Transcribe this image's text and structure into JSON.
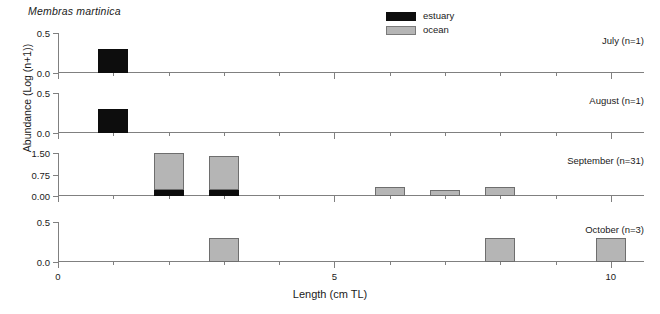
{
  "figure": {
    "species_title": "Membras martinica",
    "axis_titles": {
      "x": "Length (cm TL)",
      "y": "Abundance (Log (n+1))"
    }
  },
  "legend": {
    "items": [
      {
        "label": "estuary",
        "color": "#0d0d0d",
        "swatch_name": "estuary-swatch"
      },
      {
        "label": "ocean",
        "color": "#b5b5b5",
        "swatch_name": "ocean-swatch"
      }
    ]
  },
  "chart_data": {
    "type": "bar",
    "title": "Membras martinica",
    "xlabel": "Length (cm TL)",
    "ylabel": "Abundance (Log (n+1))",
    "grid": false,
    "legend_position": "top-center",
    "stacked": true,
    "series_names": [
      "estuary",
      "ocean"
    ],
    "series_colors": {
      "estuary": "#0d0d0d",
      "ocean": "#b5b5b5"
    },
    "xlim": [
      0,
      10.6
    ],
    "x_major_ticks": [
      0,
      5,
      10
    ],
    "x_major_tick_labels": [
      "0",
      "5",
      "10"
    ],
    "x_minor_ticks": [
      1,
      2,
      3,
      4,
      6,
      7,
      8,
      9
    ],
    "panels": [
      {
        "name": "july",
        "label": "July (n=1)",
        "ylim": [
          0,
          0.5
        ],
        "y_ticks": [
          0.0,
          0.5
        ],
        "y_tick_labels": [
          "0.0",
          "0.5"
        ],
        "bars": [
          {
            "x": 1,
            "estuary": 0.3,
            "ocean": 0
          }
        ]
      },
      {
        "name": "august",
        "label": "August (n=1)",
        "ylim": [
          0,
          0.5
        ],
        "y_ticks": [
          0.0,
          0.5
        ],
        "y_tick_labels": [
          "0.0",
          "0.5"
        ],
        "bars": [
          {
            "x": 1,
            "estuary": 0.3,
            "ocean": 0
          }
        ]
      },
      {
        "name": "september",
        "label": "September (n=31)",
        "ylim": [
          0,
          1.5
        ],
        "y_ticks": [
          0.0,
          0.75,
          1.5
        ],
        "y_tick_labels": [
          "0.00",
          "0.75",
          "1.50"
        ],
        "bars": [
          {
            "x": 2,
            "estuary": 0.2,
            "ocean": 1.3
          },
          {
            "x": 3,
            "estuary": 0.2,
            "ocean": 1.18
          },
          {
            "x": 6,
            "estuary": 0,
            "ocean": 0.3
          },
          {
            "x": 7,
            "estuary": 0,
            "ocean": 0.22
          },
          {
            "x": 8,
            "estuary": 0,
            "ocean": 0.3
          }
        ]
      },
      {
        "name": "october",
        "label": "October (n=3)",
        "ylim": [
          0,
          0.5
        ],
        "y_ticks": [
          0.0,
          0.5
        ],
        "y_tick_labels": [
          "0.0",
          "0.5"
        ],
        "bars": [
          {
            "x": 3,
            "estuary": 0,
            "ocean": 0.3
          },
          {
            "x": 8,
            "estuary": 0,
            "ocean": 0.3
          },
          {
            "x": 10,
            "estuary": 0,
            "ocean": 0.3
          }
        ]
      }
    ]
  }
}
